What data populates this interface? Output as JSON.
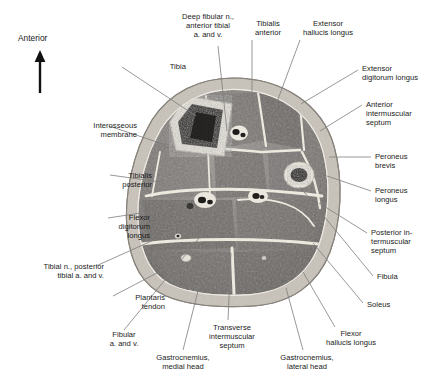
{
  "figure": {
    "orientation": {
      "label": "Anterior",
      "arrow": "up-arrow-icon",
      "x": 18,
      "y": 33
    },
    "section": {
      "type": "anatomical-cross-section",
      "modality": "grayscale photographic plastinate",
      "center_x": 233,
      "center_y": 192,
      "radius_x": 105,
      "radius_y": 114,
      "colors": {
        "skin_outer": "#b9b3ab",
        "subcutaneous_fat": "#cfc9c1",
        "fascia": "#e9e5de",
        "muscle_light": "#8e8a86",
        "muscle_mid": "#6f6b68",
        "muscle_dark": "#565350",
        "bone_cortex": "#e4e0d8",
        "marrow_dark": "#2b2926",
        "vessel_dark": "#201f1d",
        "septum_line": "#f2efe9"
      }
    },
    "leader_line_color": "#7d7d7d",
    "leader_line_width": 0.8
  },
  "labels": [
    {
      "id": "tibia",
      "text": "Tibia",
      "align": "right",
      "x": 96,
      "y": 62,
      "anchor_x": 122,
      "anchor_y": 67,
      "target_x": 196,
      "target_y": 116
    },
    {
      "id": "deep-fibular-nerve",
      "text": "Deep fibular n.,\nanterior tibial\na. and v.",
      "align": "center",
      "x": 172,
      "y": 12,
      "anchor_x": 218,
      "anchor_y": 46,
      "target_x": 227,
      "target_y": 131
    },
    {
      "id": "tibialis-anterior",
      "text": "Tibialis\nanterior",
      "align": "center",
      "x": 232,
      "y": 19,
      "anchor_x": 252,
      "anchor_y": 40,
      "target_x": 252,
      "target_y": 104
    },
    {
      "id": "extensor-hallucis-longus",
      "text": "Extensor\nhallucis longus",
      "align": "center",
      "x": 292,
      "y": 19,
      "anchor_x": 300,
      "anchor_y": 40,
      "target_x": 274,
      "target_y": 110
    },
    {
      "id": "extensor-digitorum-longus",
      "text": "Extensor\ndigitorum longus",
      "align": "left",
      "x": 362,
      "y": 64,
      "anchor_x": 358,
      "anchor_y": 70,
      "target_x": 301,
      "target_y": 104
    },
    {
      "id": "anterior-intermuscular-septum",
      "text": "Anterior\nintermuscular\nseptum",
      "align": "left",
      "x": 366,
      "y": 100,
      "anchor_x": 362,
      "anchor_y": 105,
      "target_x": 320,
      "target_y": 131
    },
    {
      "id": "peroneus-brevis",
      "text": "Peroneus\nbrevis",
      "align": "left",
      "x": 375,
      "y": 152,
      "anchor_x": 371,
      "anchor_y": 157,
      "target_x": 329,
      "target_y": 157
    },
    {
      "id": "peroneus-longus",
      "text": "Peroneus\nlongus",
      "align": "left",
      "x": 375,
      "y": 186,
      "anchor_x": 371,
      "anchor_y": 191,
      "target_x": 327,
      "target_y": 176
    },
    {
      "id": "posterior-intermuscular-septum",
      "text": "Posterior in-\ntermuscular\nseptum",
      "align": "left",
      "x": 371,
      "y": 228,
      "anchor_x": 367,
      "anchor_y": 233,
      "target_x": 319,
      "target_y": 203
    },
    {
      "id": "fibula",
      "text": "Fibula",
      "align": "left",
      "x": 377,
      "y": 272,
      "anchor_x": 373,
      "anchor_y": 276,
      "target_x": 300,
      "target_y": 187
    },
    {
      "id": "soleus",
      "text": "Soleus",
      "align": "left",
      "x": 367,
      "y": 300,
      "anchor_x": 363,
      "anchor_y": 303,
      "target_x": 313,
      "target_y": 243
    },
    {
      "id": "flexor-hallucis-longus",
      "text": "Flexor\nhallucis longus",
      "align": "center",
      "x": 315,
      "y": 329,
      "anchor_x": 335,
      "anchor_y": 327,
      "target_x": 303,
      "target_y": 272
    },
    {
      "id": "gastrocnemius-lateral-head",
      "text": "Gastrocnemius,\nlateral head",
      "align": "center",
      "x": 271,
      "y": 353,
      "anchor_x": 303,
      "anchor_y": 350,
      "target_x": 286,
      "target_y": 288
    },
    {
      "id": "transverse-intermuscular-septum",
      "text": "Transverse\nintermuscular\nseptum",
      "align": "center",
      "x": 196,
      "y": 323,
      "anchor_x": 228,
      "anchor_y": 320,
      "target_x": 231,
      "target_y": 253
    },
    {
      "id": "gastrocnemius-medial-head",
      "text": "Gastrocnemius,\nmedial head",
      "align": "center",
      "x": 147,
      "y": 353,
      "anchor_x": 183,
      "anchor_y": 350,
      "target_x": 199,
      "target_y": 287
    },
    {
      "id": "fibular-artery-vein",
      "text": "Fibular\na. and v.",
      "align": "center",
      "x": 88,
      "y": 330,
      "anchor_x": 124,
      "anchor_y": 330,
      "target_x": 200,
      "target_y": 237
    },
    {
      "id": "plantaris-tendon",
      "text": "Plantaris\ntendon",
      "align": "right",
      "x": 75,
      "y": 293,
      "anchor_x": 113,
      "anchor_y": 296,
      "target_x": 178,
      "target_y": 262
    },
    {
      "id": "tibial-nerve-posterior-tibial",
      "text": "Tibial n., posterior\ntibial a. and v.",
      "align": "right",
      "x": 14,
      "y": 262,
      "anchor_x": 96,
      "anchor_y": 266,
      "target_x": 176,
      "target_y": 230
    },
    {
      "id": "flexor-digitorum-longus",
      "text": "Flexor\ndigitorum\nlongus",
      "align": "right",
      "x": 60,
      "y": 213,
      "anchor_x": 108,
      "anchor_y": 218,
      "target_x": 167,
      "target_y": 209
    },
    {
      "id": "tibialis-posterior",
      "text": "Tibialis\nposterior",
      "align": "right",
      "x": 62,
      "y": 171,
      "anchor_x": 110,
      "anchor_y": 175,
      "target_x": 160,
      "target_y": 182
    },
    {
      "id": "interosseous-membrane",
      "text": "Interosseous\nmembrane",
      "align": "right",
      "x": 47,
      "y": 121,
      "anchor_x": 109,
      "anchor_y": 126,
      "target_x": 166,
      "target_y": 145
    }
  ]
}
